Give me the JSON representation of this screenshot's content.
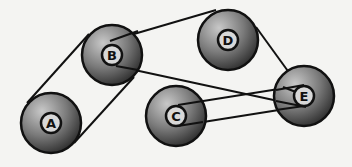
{
  "diagram": {
    "title": "",
    "pulleys": [
      {
        "id": "A",
        "label": "A",
        "cx": 51,
        "cy": 123,
        "r": 31
      },
      {
        "id": "B",
        "label": "B",
        "cx": 112,
        "cy": 55,
        "r": 31
      },
      {
        "id": "C",
        "label": "C",
        "cx": 176,
        "cy": 116,
        "r": 31
      },
      {
        "id": "D",
        "label": "D",
        "cx": 228,
        "cy": 40,
        "r": 31
      },
      {
        "id": "E",
        "label": "E",
        "cx": 304,
        "cy": 96,
        "r": 31
      }
    ],
    "belts": [
      {
        "from": "A",
        "to": "B",
        "type": "open"
      },
      {
        "from": "B",
        "to": "D",
        "via": "E",
        "type": "loop"
      },
      {
        "from": "C",
        "to": "E",
        "type": "open"
      }
    ],
    "colors": {
      "background": "#f4f4f2",
      "pulley_dark": "#3a3a3a",
      "pulley_light": "#b8b8b8",
      "stroke": "#111111",
      "hub": "#d8d8d8"
    }
  }
}
